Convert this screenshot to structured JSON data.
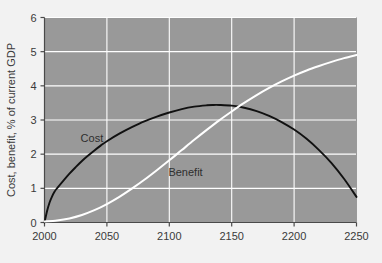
{
  "chart_data": {
    "type": "line",
    "title": "",
    "subtitle": "",
    "xlabel": "",
    "ylabel": "Cost, benefit, % of current GDP",
    "xlim": [
      2000,
      2250
    ],
    "ylim": [
      0,
      6
    ],
    "xticks": [
      2000,
      2050,
      2100,
      2150,
      2200,
      2250
    ],
    "xtick_labels": [
      "2000",
      "2050",
      "2100",
      "2150",
      "2200",
      "2250"
    ],
    "yticks": [
      0,
      1,
      2,
      3,
      4,
      5,
      6
    ],
    "ytick_labels": [
      "0",
      "1",
      "2",
      "3",
      "4",
      "5",
      "6"
    ],
    "grid": true,
    "grid_color": "#ffffff",
    "plot_background": "#999999",
    "page_background": "#f2f2f2",
    "legend_position": "inline-annotation",
    "series": [
      {
        "name": "Cost",
        "color": "#111111",
        "label_x": 2038,
        "label_y": 2.35,
        "x": [
          2000,
          2002,
          2004,
          2006,
          2008,
          2010,
          2015,
          2020,
          2025,
          2030,
          2035,
          2040,
          2045,
          2050,
          2060,
          2070,
          2080,
          2090,
          2100,
          2110,
          2120,
          2130,
          2135,
          2140,
          2150,
          2160,
          2170,
          2180,
          2190,
          2200,
          2210,
          2220,
          2230,
          2240,
          2250
        ],
        "values": [
          0.0,
          0.33,
          0.58,
          0.76,
          0.9,
          1.0,
          1.22,
          1.43,
          1.62,
          1.8,
          1.96,
          2.11,
          2.25,
          2.38,
          2.6,
          2.79,
          2.96,
          3.1,
          3.22,
          3.32,
          3.39,
          3.43,
          3.44,
          3.44,
          3.42,
          3.36,
          3.26,
          3.12,
          2.94,
          2.72,
          2.45,
          2.12,
          1.74,
          1.28,
          0.75
        ]
      },
      {
        "name": "Benefit",
        "color": "#ffffff",
        "label_x": 2113,
        "label_y": 1.35,
        "x": [
          2000,
          2010,
          2020,
          2030,
          2040,
          2050,
          2060,
          2070,
          2080,
          2090,
          2100,
          2110,
          2120,
          2130,
          2140,
          2150,
          2160,
          2170,
          2180,
          2190,
          2200,
          2210,
          2220,
          2230,
          2240,
          2250
        ],
        "values": [
          0.03,
          0.06,
          0.12,
          0.22,
          0.36,
          0.54,
          0.75,
          0.99,
          1.25,
          1.53,
          1.82,
          2.12,
          2.42,
          2.71,
          2.99,
          3.25,
          3.5,
          3.73,
          3.94,
          4.13,
          4.3,
          4.45,
          4.58,
          4.7,
          4.81,
          4.9
        ]
      }
    ]
  },
  "axes": {
    "y_axis_title": "Cost, benefit, % of current GDP"
  }
}
